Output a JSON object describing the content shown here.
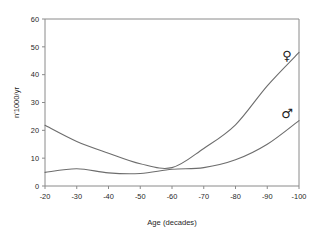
{
  "chart_data": {
    "type": "line",
    "title": "",
    "xlabel": "Age (decades)",
    "ylabel": "n'1000/yr",
    "xlim": [
      -20,
      -100
    ],
    "ylim": [
      0,
      60
    ],
    "grid": false,
    "legend_position": "inline-right-endpoint-symbols",
    "x": [
      -20,
      -30,
      -40,
      -50,
      -60,
      -70,
      -80,
      -90,
      -100
    ],
    "xticklabels": [
      "-20",
      "-30",
      "-40",
      "-50",
      "-60",
      "-70",
      "-80",
      "-90",
      "-100"
    ],
    "yticks": [
      0,
      10,
      20,
      30,
      40,
      50,
      60
    ],
    "yticklabels": [
      "0",
      "10",
      "20",
      "30",
      "40",
      "50",
      "60"
    ],
    "series": [
      {
        "name": "female",
        "symbol": "♀",
        "symbol_name": "venus-female-symbol",
        "endpoint_value": 47,
        "values": [
          21.8,
          16.0,
          11.8,
          8.0,
          6.6,
          13.5,
          22.0,
          36.0,
          48.0
        ]
      },
      {
        "name": "male",
        "symbol": "♂",
        "symbol_name": "mars-male-symbol",
        "endpoint_value": 26,
        "values": [
          4.9,
          6.2,
          4.7,
          4.5,
          6.0,
          6.6,
          9.4,
          15.0,
          23.5
        ]
      }
    ],
    "colors": {
      "line": "#6d6d6d",
      "axis": "#8a8a8a",
      "text": "#1f1f1f",
      "background": "#ffffff"
    }
  }
}
